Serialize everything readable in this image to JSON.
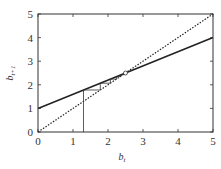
{
  "chart_data": {
    "type": "line",
    "title": "",
    "xlabel": "b_t",
    "ylabel": "b_{t+1}",
    "xlim": [
      0,
      5
    ],
    "ylim": [
      0,
      5
    ],
    "x_ticks": [
      "0",
      "1",
      "2",
      "3",
      "4",
      "5"
    ],
    "y_ticks": [
      "0",
      "1",
      "2",
      "3",
      "4",
      "5"
    ],
    "grid": false,
    "legend": null,
    "series": [
      {
        "name": "map",
        "style": "solid",
        "x": [
          0,
          5
        ],
        "y": [
          1,
          4
        ]
      },
      {
        "name": "identity",
        "style": "dotted",
        "x": [
          0,
          5
        ],
        "y": [
          0,
          5
        ]
      }
    ],
    "cobweb": {
      "start": 1.3,
      "slope": 0.6,
      "intercept": 1.0,
      "iterations": 7,
      "fixed_point": [
        2.5,
        2.5
      ]
    }
  },
  "labels": {
    "xlabel_main": "b",
    "xlabel_sub": "t",
    "ylabel_main": "b",
    "ylabel_sub": "t+1"
  }
}
